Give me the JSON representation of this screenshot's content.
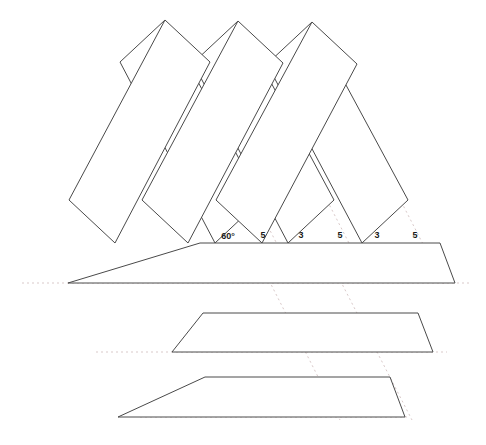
{
  "figure": {
    "background_color": "#ffffff",
    "solid_stroke_color": "#4a4a4a",
    "dotted_stroke_color": "#d9c9c9",
    "solid_stroke_width": 1,
    "dotted_stroke_width": 1,
    "dash_pattern": "2,3"
  },
  "labels": [
    {
      "text": "60°",
      "x": 228,
      "y": 236
    },
    {
      "text": "5",
      "x": 263,
      "y": 235
    },
    {
      "text": "3",
      "x": 301,
      "y": 235
    },
    {
      "text": "5",
      "x": 340,
      "y": 235
    },
    {
      "text": "3",
      "x": 377,
      "y": 235
    },
    {
      "text": "5",
      "x": 415,
      "y": 235
    }
  ],
  "measurements": {
    "angle": "60°",
    "segment_long": "5",
    "segment_short": "3",
    "sequence": [
      "5",
      "3",
      "5",
      "3",
      "5"
    ]
  },
  "strips": {
    "horizontal": [
      {
        "name": "horizontal-strip-top",
        "points": "200,243 440,243 455,283 68,283"
      },
      {
        "name": "horizontal-strip-middle",
        "points": "203,313 418,313 433,352 172,352"
      },
      {
        "name": "horizontal-strip-bottom",
        "points": "205,377 390,377 405,417 118,417"
      }
    ],
    "down_right": [
      {
        "name": "down-right-strip-1",
        "points": "165,20 210,62 115,243 69,200"
      },
      {
        "name": "down-right-strip-2",
        "points": "238,21 283,63 188,243 142,200"
      },
      {
        "name": "down-right-strip-3",
        "points": "312,22 357,64 262,243 216,200"
      }
    ],
    "down_left": [
      {
        "name": "down-left-strip-1",
        "points": "165,20 120,62 215,243 261,200"
      },
      {
        "name": "down-left-strip-2",
        "points": "238,21 193,63 288,243 334,200"
      },
      {
        "name": "down-left-strip-3",
        "points": "312,22 267,64 362,243 408,200"
      }
    ]
  },
  "guides": {
    "horizontal_dotted": [
      {
        "name": "guide-h-1",
        "x1": 22,
        "y1": 283,
        "x2": 470,
        "y2": 283
      },
      {
        "name": "guide-h-2",
        "x1": 96,
        "y1": 352,
        "x2": 447,
        "y2": 352
      },
      {
        "name": "guide-h-3",
        "x1": 140,
        "y1": 417,
        "x2": 410,
        "y2": 417
      }
    ],
    "diagonal_dotted": [
      {
        "name": "guide-d-1",
        "x1": 163,
        "y1": 22,
        "x2": 297,
        "y2": 283
      },
      {
        "name": "guide-d-2",
        "x1": 236,
        "y1": 23,
        "x2": 370,
        "y2": 284
      },
      {
        "name": "guide-d-3",
        "x1": 310,
        "y1": 24,
        "x2": 444,
        "y2": 285
      },
      {
        "name": "guide-d-4",
        "x1": 251,
        "y1": 245,
        "x2": 340,
        "y2": 420
      },
      {
        "name": "guide-d-5",
        "x1": 322,
        "y1": 245,
        "x2": 412,
        "y2": 420
      }
    ]
  }
}
